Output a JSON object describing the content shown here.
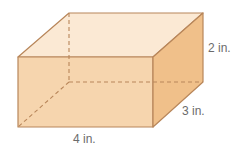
{
  "figure": {
    "type": "rectangular-prism",
    "labels": {
      "length": "4 in.",
      "width": "3 in.",
      "height": "2 in."
    },
    "colors": {
      "top_face": "#FBE9D4",
      "front_face": "#F6D5AE",
      "right_face": "#F0C08A",
      "edge": "#B8865A",
      "hidden_edge": "#B8865A",
      "label_text": "#6b6b6b"
    }
  }
}
